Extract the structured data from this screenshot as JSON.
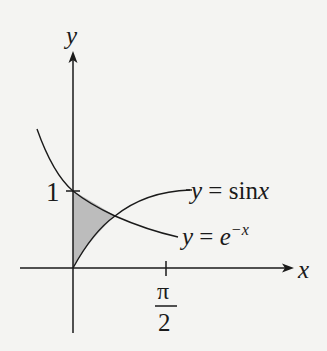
{
  "diagram": {
    "axes": {
      "x_label": "x",
      "y_label": "y",
      "y_tick_label": "1",
      "x_tick_label_numerator": "π",
      "x_tick_label_denominator": "2"
    },
    "curves": [
      {
        "name": "sine",
        "label_lhs": "y",
        "label_eq": "=",
        "label_rhs": "sin",
        "label_var": "x"
      },
      {
        "name": "exp-decay",
        "label_lhs": "y",
        "label_eq": "=",
        "label_base": "e",
        "label_exp": "−x"
      }
    ],
    "shaded_region": {
      "description": "region between y=e^-x and y=sin x from x=0 to their intersection",
      "color": "#bcbcbc"
    },
    "colors": {
      "line": "#1a1a1a",
      "background": "#f4f4f2",
      "shade": "#bcbcbc"
    }
  }
}
